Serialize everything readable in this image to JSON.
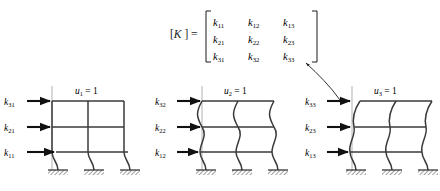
{
  "figure": {
    "matrix": {
      "label": "[K] =",
      "symbol": "K",
      "rows": [
        [
          "k11",
          "k12",
          "k13"
        ],
        [
          "k21",
          "k22",
          "k23"
        ],
        [
          "k31",
          "k32",
          "k33"
        ]
      ],
      "display_rows": [
        [
          "k",
          "k",
          "k"
        ],
        [
          "k",
          "k",
          "k"
        ],
        [
          "k",
          "k",
          "k"
        ]
      ],
      "subscripts": [
        [
          "11",
          "12",
          "13"
        ],
        [
          "21",
          "22",
          "23"
        ],
        [
          "31",
          "32",
          "33"
        ]
      ],
      "bracket_style": "square"
    },
    "callout": {
      "name": "curved-arrow",
      "description": "curved arrow from third frame up to the third column of the matrix",
      "points_from": "k33-force-label",
      "points_to": "matrix-column-3"
    },
    "frames": [
      {
        "id": "frame-1",
        "displacement_label": "u",
        "displacement_sub": "1",
        "displacement_value": "= 1",
        "displacement_text": "u1 = 1",
        "dof": 1,
        "deformed_story": 1,
        "stories": 3,
        "bays": 2,
        "supports": 3,
        "forces": [
          {
            "symbol": "k",
            "sub": "31",
            "level": 3,
            "text": "k31"
          },
          {
            "symbol": "k",
            "sub": "21",
            "level": 2,
            "text": "k21"
          },
          {
            "symbol": "k",
            "sub": "11",
            "level": 1,
            "text": "k11"
          }
        ]
      },
      {
        "id": "frame-2",
        "displacement_label": "u",
        "displacement_sub": "2",
        "displacement_value": "= 1",
        "displacement_text": "u2 = 1",
        "dof": 2,
        "deformed_story": 2,
        "stories": 3,
        "bays": 2,
        "supports": 3,
        "forces": [
          {
            "symbol": "k",
            "sub": "32",
            "level": 3,
            "text": "k32"
          },
          {
            "symbol": "k",
            "sub": "22",
            "level": 2,
            "text": "k22"
          },
          {
            "symbol": "k",
            "sub": "12",
            "level": 1,
            "text": "k12"
          }
        ]
      },
      {
        "id": "frame-3",
        "displacement_label": "u",
        "displacement_sub": "3",
        "displacement_value": "= 1",
        "displacement_text": "u3 = 1",
        "dof": 3,
        "deformed_story": 3,
        "stories": 3,
        "bays": 2,
        "supports": 3,
        "forces": [
          {
            "symbol": "k",
            "sub": "33",
            "level": 3,
            "text": "k33"
          },
          {
            "symbol": "k",
            "sub": "23",
            "level": 2,
            "text": "k23"
          },
          {
            "symbol": "k",
            "sub": "13",
            "level": 1,
            "text": "k13"
          }
        ]
      }
    ],
    "colors": {
      "ink": "#1a1a1a",
      "frame_line": "#3a3a3a",
      "reference_line": "#b8b8b8",
      "arrow": "#111111",
      "background": "#ffffff"
    }
  }
}
